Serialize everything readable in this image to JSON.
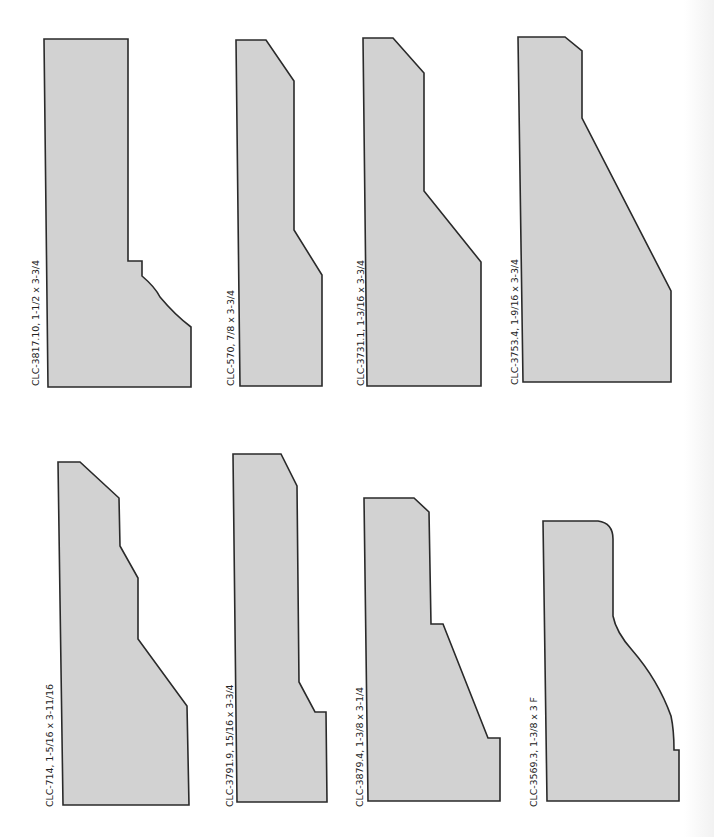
{
  "colors": {
    "fill": "#d2d2d2",
    "stroke": "#2a2a2a",
    "background": "#ffffff"
  },
  "profiles": [
    {
      "id": "CLC-3817.10",
      "size": "1-1/2 x 3-3/4",
      "label": "CLC-3817.10,  1-1/2 x 3-3/4",
      "path": "M 44 39 L 128 39 L 128 261 L 142 261 L 142 276 Q 155 287 160 297 Q 175 315 191 327 L 191 387 L 48 387 Z"
    },
    {
      "id": "CLC-570",
      "size": "7/8 x 3-3/4",
      "label": "CLC-570,  7/8 x 3-3/4",
      "path": "M 236 40 L 266 40 L 294 81 L 294 230 L 322 275 L 322 386 L 240 386 Z"
    },
    {
      "id": "CLC-3731.1",
      "size": "1-3/16 x 3-3/4",
      "label": "CLC-3731.1,  1-3/16 x 3-3/4",
      "path": "M 363 38 L 393 38 L 424 73 L 424 191 L 481 262 L 481 386 L 367 386 Z"
    },
    {
      "id": "CLC-3753.4",
      "size": "1-9/16 x 3-3/4",
      "label": "CLC-3753.4,  1-9/16 x 3-3/4",
      "path": "M 518 37 L 565 37 L 582 51 L 582 118 L 671 291 L 671 382 L 523 382 Z"
    },
    {
      "id": "CLC-714",
      "size": "1-5/16 x 3-11/16",
      "label": "CLC-714,  1-5/16 x 3-11/16",
      "path": "M 58 462 L 80 462 L 119 498 L 120 546 L 138 578 L 138 639 L 187 706 L 189 805 L 63 805 Z"
    },
    {
      "id": "CLC-3791.9",
      "size": "15/16 x 3-3/4",
      "label": "CLC-3791.9,  15/16 x 3-3/4",
      "path": "M 233 454 L 281 454 L 297 486 L 299 682 L 315 712 L 326 712 L 327 802 L 237 802 Z"
    },
    {
      "id": "CLC-3879.4",
      "size": "1-3/8 x 3-1/4",
      "label": "CLC-3879.4,  1-3/8 x 3-1/4",
      "path": "M 364 498 L 414 498 L 429 512 L 431 624 L 443 624 L 488 738 L 500 738 L 500 801 L 368 801 Z"
    },
    {
      "id": "CLC-3569.3",
      "size": "1-3/8 x 3 F",
      "label": "CLC-3569.3,  1-3/8 x 3 F",
      "path": "M 543 521 L 598 521 Q 613 523 613 539 L 613 616 Q 616 632 632 650 Q 658 680 671 716 Q 674 730 674 750 L 679 750 L 679 801 L 547 801 Z"
    }
  ],
  "labels": [
    {
      "text": "CLC-3817.10,  1-1/2 x 3-3/4",
      "x": 30,
      "y": 385
    },
    {
      "text": "CLC-570,  7/8 x 3-3/4",
      "x": 225,
      "y": 385
    },
    {
      "text": "CLC-3731.1,  1-3/16 x 3-3/4",
      "x": 355,
      "y": 385
    },
    {
      "text": "CLC-3753.4,  1-9/16 x 3-3/4",
      "x": 509,
      "y": 384
    },
    {
      "text": "CLC-714,  1-5/16 x 3-11/16",
      "x": 44,
      "y": 806
    },
    {
      "text": "CLC-3791.9,  15/16 x 3-3/4",
      "x": 224,
      "y": 806
    },
    {
      "text": "CLC-3879.4,  1-3/8 x 3-1/4",
      "x": 354,
      "y": 806
    },
    {
      "text": "CLC-3569.3,  1-3/8 x 3 F",
      "x": 528,
      "y": 806
    }
  ]
}
